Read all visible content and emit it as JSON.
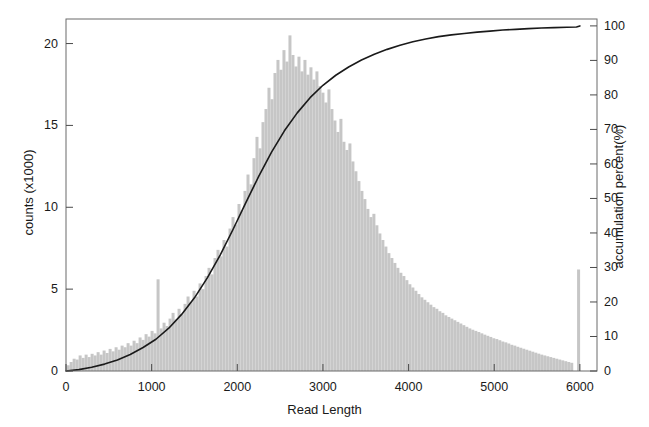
{
  "chart_data": {
    "type": "bar",
    "title": "",
    "subtitle": "",
    "xlabel": "Read Length",
    "ylabel": "counts (x1000)",
    "y2label": "accumulation percent(%)",
    "xlim": [
      0,
      6200
    ],
    "ylim": [
      0,
      21.5
    ],
    "y2lim": [
      0,
      102
    ],
    "grid": false,
    "legend": null,
    "xticks": [
      0,
      1000,
      2000,
      3000,
      4000,
      5000,
      6000
    ],
    "xticklabels": [
      "0",
      "1000",
      "2000",
      "3000",
      "4000",
      "5000",
      "6000"
    ],
    "yticks": [
      0,
      5,
      10,
      15,
      20
    ],
    "yticklabels": [
      "0",
      "5",
      "10",
      "15",
      "20"
    ],
    "y2ticks": [
      0,
      10,
      20,
      30,
      40,
      50,
      60,
      70,
      80,
      90,
      100
    ],
    "y2ticklabels": [
      "0",
      "10",
      "20",
      "30",
      "40",
      "50",
      "60",
      "70",
      "80",
      "90",
      "100"
    ],
    "bar_color": "#c6c6c6",
    "line_color": "#1a1a1a",
    "bar_width": 35,
    "series": [
      {
        "name": "counts",
        "type": "bar",
        "axis": "left",
        "x": [
          25,
          60,
          95,
          130,
          165,
          200,
          235,
          270,
          305,
          340,
          375,
          410,
          445,
          480,
          515,
          550,
          585,
          620,
          655,
          690,
          725,
          760,
          795,
          830,
          865,
          900,
          935,
          970,
          1005,
          1040,
          1075,
          1110,
          1145,
          1180,
          1215,
          1250,
          1285,
          1320,
          1355,
          1390,
          1425,
          1460,
          1495,
          1530,
          1565,
          1600,
          1635,
          1670,
          1705,
          1740,
          1775,
          1810,
          1845,
          1880,
          1915,
          1950,
          1985,
          2020,
          2055,
          2090,
          2125,
          2160,
          2195,
          2230,
          2265,
          2300,
          2335,
          2370,
          2405,
          2440,
          2475,
          2510,
          2545,
          2580,
          2615,
          2650,
          2685,
          2720,
          2755,
          2790,
          2825,
          2860,
          2895,
          2930,
          2965,
          3000,
          3035,
          3070,
          3105,
          3140,
          3175,
          3210,
          3245,
          3280,
          3315,
          3350,
          3385,
          3420,
          3455,
          3490,
          3525,
          3560,
          3595,
          3630,
          3665,
          3700,
          3735,
          3770,
          3805,
          3840,
          3875,
          3910,
          3945,
          3980,
          4015,
          4050,
          4085,
          4120,
          4155,
          4190,
          4225,
          4260,
          4295,
          4330,
          4365,
          4400,
          4435,
          4470,
          4505,
          4540,
          4575,
          4610,
          4645,
          4680,
          4715,
          4750,
          4785,
          4820,
          4855,
          4890,
          4925,
          4960,
          4995,
          5030,
          5065,
          5100,
          5135,
          5170,
          5205,
          5240,
          5275,
          5310,
          5345,
          5380,
          5415,
          5450,
          5485,
          5520,
          5555,
          5590,
          5625,
          5660,
          5695,
          5730,
          5765,
          5800,
          5835,
          5870,
          5905,
          5985
        ],
        "values": [
          0.35,
          0.55,
          0.75,
          0.7,
          0.95,
          0.8,
          1.0,
          0.85,
          1.05,
          0.95,
          1.15,
          1.0,
          1.25,
          1.1,
          1.35,
          1.2,
          1.45,
          1.3,
          1.55,
          1.45,
          1.7,
          1.55,
          1.85,
          1.7,
          2.05,
          1.9,
          2.25,
          2.1,
          2.45,
          2.3,
          5.6,
          2.6,
          2.95,
          2.75,
          3.2,
          3.55,
          3.15,
          3.8,
          3.45,
          4.1,
          4.55,
          4.2,
          4.9,
          4.55,
          5.35,
          5.0,
          5.8,
          6.3,
          5.9,
          6.9,
          7.4,
          7.0,
          8.0,
          7.6,
          8.7,
          9.4,
          8.95,
          10.2,
          9.8,
          11.0,
          12.0,
          11.4,
          13.0,
          14.3,
          13.6,
          15.2,
          16.0,
          17.3,
          16.6,
          18.2,
          19.0,
          18.4,
          19.6,
          18.9,
          20.5,
          19.3,
          18.6,
          19.2,
          18.3,
          19.0,
          18.1,
          18.55,
          17.8,
          18.3,
          17.4,
          17.0,
          16.4,
          17.2,
          16.0,
          15.3,
          14.6,
          15.4,
          14.0,
          13.5,
          13.9,
          12.8,
          12.2,
          11.6,
          11.0,
          10.5,
          9.9,
          9.4,
          9.6,
          8.9,
          8.4,
          8.0,
          7.6,
          7.2,
          6.9,
          6.6,
          6.3,
          6.0,
          5.8,
          5.55,
          5.3,
          5.1,
          4.9,
          4.7,
          4.5,
          4.35,
          4.2,
          4.05,
          3.9,
          3.8,
          3.65,
          3.55,
          3.4,
          3.3,
          3.2,
          3.1,
          3.0,
          2.9,
          2.8,
          2.7,
          2.6,
          2.52,
          2.45,
          2.38,
          2.3,
          2.22,
          2.15,
          2.08,
          2.0,
          1.95,
          1.88,
          1.8,
          1.75,
          1.68,
          1.6,
          1.55,
          1.48,
          1.42,
          1.36,
          1.3,
          1.24,
          1.18,
          1.12,
          1.06,
          1.0,
          0.95,
          0.9,
          0.85,
          0.8,
          0.75,
          0.7,
          0.65,
          0.6,
          0.55,
          0.5,
          6.2
        ]
      },
      {
        "name": "accumulation percent",
        "type": "line",
        "axis": "right",
        "x": [
          0,
          150,
          300,
          450,
          600,
          750,
          900,
          1050,
          1200,
          1350,
          1500,
          1650,
          1800,
          1950,
          2100,
          2250,
          2400,
          2550,
          2700,
          2850,
          3000,
          3150,
          3300,
          3450,
          3600,
          3750,
          3900,
          4050,
          4200,
          4350,
          4500,
          4650,
          4800,
          4950,
          5100,
          5250,
          5400,
          5550,
          5700,
          5850,
          5960,
          6000
        ],
        "values": [
          0.0,
          0.4,
          1.1,
          2.0,
          3.2,
          4.8,
          6.8,
          9.2,
          12.4,
          16.4,
          21.2,
          27.0,
          33.6,
          41.0,
          48.8,
          56.4,
          63.4,
          69.6,
          74.8,
          79.2,
          82.8,
          85.7,
          88.1,
          90.1,
          91.8,
          93.2,
          94.4,
          95.4,
          96.2,
          96.9,
          97.4,
          97.8,
          98.2,
          98.5,
          98.8,
          99.0,
          99.2,
          99.4,
          99.5,
          99.6,
          99.7,
          100.0
        ]
      }
    ]
  }
}
